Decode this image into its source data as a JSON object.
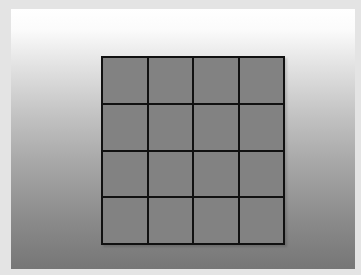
{
  "board": {
    "rows": 4,
    "cols": 4,
    "cell_color": "#828282",
    "line_color": "#111111",
    "cells": [
      [
        {
          "value": ""
        },
        {
          "value": ""
        },
        {
          "value": ""
        },
        {
          "value": ""
        }
      ],
      [
        {
          "value": ""
        },
        {
          "value": ""
        },
        {
          "value": ""
        },
        {
          "value": ""
        }
      ],
      [
        {
          "value": ""
        },
        {
          "value": ""
        },
        {
          "value": ""
        },
        {
          "value": ""
        }
      ],
      [
        {
          "value": ""
        },
        {
          "value": ""
        },
        {
          "value": ""
        },
        {
          "value": ""
        }
      ]
    ]
  },
  "background": {
    "gradient_top": "#ffffff",
    "gradient_bottom": "#767676",
    "frame_color": "#e4e4e4"
  }
}
